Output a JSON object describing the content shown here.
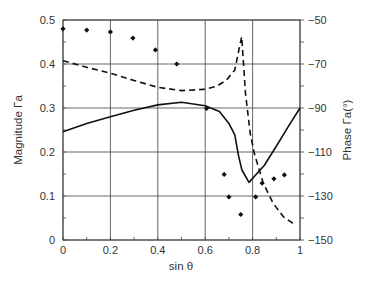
{
  "chart_data": {
    "type": "line",
    "title": "",
    "xlabel": "sin θ",
    "ylabel": "Magnitude Γa",
    "y2label": "Phase Γa(°)",
    "xlim": [
      0,
      1
    ],
    "ylim": [
      0,
      0.5
    ],
    "y2lim": [
      -150,
      -50
    ],
    "grid": true,
    "legend": "none",
    "x_ticks": [
      "0",
      "0.2",
      "0.4",
      "0.6",
      "0.8",
      "1"
    ],
    "y_ticks": [
      "0",
      "0.1",
      "0.2",
      "0.3",
      "0.4",
      "0.5"
    ],
    "y2_ticks": [
      "-150",
      "-130",
      "-110",
      "-90",
      "-70",
      "-50"
    ],
    "series": [
      {
        "name": "Magnitude Γa",
        "axis": "left",
        "style": "solid",
        "x": [
          0,
          0.1,
          0.2,
          0.3,
          0.4,
          0.5,
          0.6,
          0.66,
          0.7,
          0.725,
          0.74,
          0.755,
          0.785,
          0.85,
          0.9,
          0.95,
          1.0
        ],
        "y": [
          0.246,
          0.265,
          0.28,
          0.295,
          0.307,
          0.313,
          0.305,
          0.292,
          0.265,
          0.239,
          0.193,
          0.159,
          0.131,
          0.17,
          0.213,
          0.257,
          0.3
        ]
      },
      {
        "name": "Phase Γa",
        "axis": "right",
        "style": "dashed",
        "x": [
          0,
          0.1,
          0.2,
          0.3,
          0.4,
          0.5,
          0.6,
          0.65,
          0.69,
          0.725,
          0.745,
          0.754,
          0.77,
          0.79,
          0.807,
          0.845,
          0.887,
          0.93,
          0.98
        ],
        "y": [
          -68.5,
          -71.5,
          -74.2,
          -77.5,
          -80.6,
          -82.1,
          -81.5,
          -80,
          -77.3,
          -72.7,
          -62,
          -57.6,
          -83.3,
          -101.5,
          -110.6,
          -124.2,
          -133.3,
          -139.4,
          -143.2
        ]
      },
      {
        "name": "Measured",
        "axis": "left",
        "style": "markers",
        "x": [
          0,
          0.1,
          0.2,
          0.295,
          0.39,
          0.48,
          0.606,
          0.68,
          0.7,
          0.75,
          0.813,
          0.84,
          0.89,
          0.934
        ],
        "y": [
          0.48,
          0.477,
          0.473,
          0.459,
          0.432,
          0.4,
          0.299,
          0.149,
          0.098,
          0.058,
          0.098,
          0.129,
          0.139,
          0.148
        ]
      }
    ]
  }
}
